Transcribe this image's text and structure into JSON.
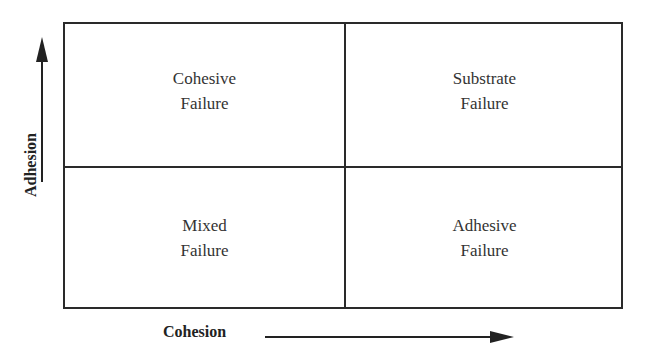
{
  "diagram": {
    "type": "2x2 quadrant",
    "x_axis": {
      "label": "Cohesion",
      "direction": "increasing-right"
    },
    "y_axis": {
      "label": "Adhesion",
      "direction": "increasing-up"
    },
    "quadrants": {
      "top_left": {
        "line1": "Cohesive",
        "line2": "Failure"
      },
      "top_right": {
        "line1": "Substrate",
        "line2": "Failure"
      },
      "bottom_left": {
        "line1": "Mixed",
        "line2": "Failure"
      },
      "bottom_right": {
        "line1": "Adhesive",
        "line2": "Failure"
      }
    },
    "colors": {
      "line": "#2a2a2a",
      "text": "#333333",
      "background": "#ffffff"
    }
  }
}
